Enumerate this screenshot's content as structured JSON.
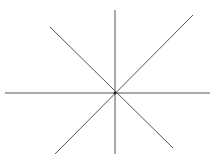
{
  "diagram": {
    "type": "star-of-lines",
    "center": [
      115,
      93
    ],
    "stroke_color": "#555555",
    "background": "#ffffff",
    "lines": [
      {
        "name": "vertical-line",
        "x1": 115,
        "y1": 10,
        "x2": 115,
        "y2": 154
      },
      {
        "name": "horizontal-line",
        "x1": 5,
        "y1": 93,
        "x2": 210,
        "y2": 93
      },
      {
        "name": "diagonal-line-1",
        "x1": 50,
        "y1": 27,
        "x2": 173,
        "y2": 148
      },
      {
        "name": "diagonal-line-2",
        "x1": 193,
        "y1": 15,
        "x2": 55,
        "y2": 154
      }
    ]
  }
}
